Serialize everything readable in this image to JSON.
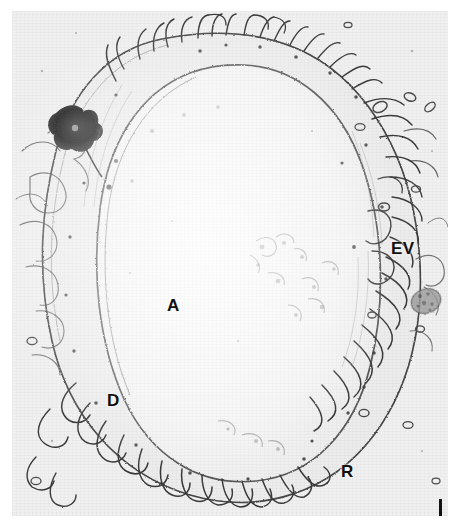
{
  "figure": {
    "kind": "electron-micrograph",
    "background_color": "#f1f1f1",
    "page_background": "#ffffff",
    "ink_color": "#3a3a3a",
    "label_color": "#101010"
  },
  "labels": [
    {
      "id": "A",
      "text": "A",
      "name": "label-lumen-a"
    },
    {
      "id": "D",
      "text": "D",
      "name": "label-d"
    },
    {
      "id": "EV",
      "text": "EV",
      "name": "label-ev"
    },
    {
      "id": "R",
      "text": "R",
      "name": "label-r"
    }
  ],
  "scale_bar": {
    "orientation": "vertical",
    "caption": "",
    "color": "#111111"
  }
}
